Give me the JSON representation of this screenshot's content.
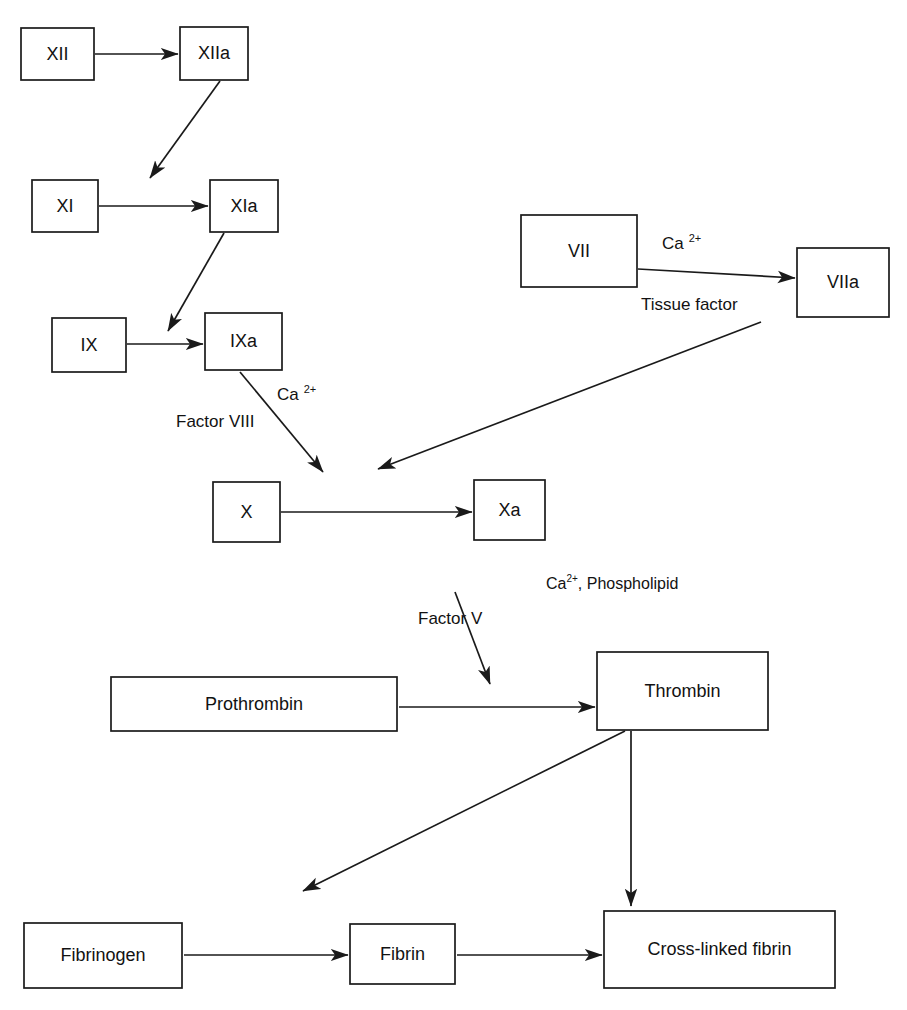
{
  "diagram": {
    "background_color": "#ffffff",
    "stroke_color": "#1a1a1a",
    "text_color": "#121212"
  },
  "nodes": {
    "xii": {
      "label": "XII",
      "x": 21,
      "y": 28,
      "w": 73,
      "h": 52,
      "font_size": 18
    },
    "xiia": {
      "label": "XIIa",
      "x": 180,
      "y": 27,
      "w": 68,
      "h": 53,
      "font_size": 18
    },
    "xi": {
      "label": "XI",
      "x": 32,
      "y": 180,
      "w": 66,
      "h": 52,
      "font_size": 18
    },
    "xia": {
      "label": "XIa",
      "x": 210,
      "y": 180,
      "w": 68,
      "h": 52,
      "font_size": 18
    },
    "ix": {
      "label": "IX",
      "x": 52,
      "y": 318,
      "w": 74,
      "h": 54,
      "font_size": 18
    },
    "ixa": {
      "label": "IXa",
      "x": 205,
      "y": 313,
      "w": 77,
      "h": 57,
      "font_size": 18
    },
    "vii": {
      "label": "VII",
      "x": 521,
      "y": 215,
      "w": 116,
      "h": 72,
      "font_size": 18
    },
    "viia": {
      "label": "VIIa",
      "x": 797,
      "y": 248,
      "w": 92,
      "h": 69,
      "font_size": 18
    },
    "x": {
      "label": "X",
      "x": 213,
      "y": 482,
      "w": 67,
      "h": 60,
      "font_size": 18
    },
    "xa": {
      "label": "Xa",
      "x": 474,
      "y": 480,
      "w": 71,
      "h": 60,
      "font_size": 18
    },
    "prothrombin": {
      "label": "Prothrombin",
      "x": 111,
      "y": 677,
      "w": 286,
      "h": 54,
      "font_size": 18
    },
    "thrombin": {
      "label": "Thrombin",
      "x": 597,
      "y": 652,
      "w": 171,
      "h": 78,
      "font_size": 18
    },
    "fibrinogen": {
      "label": "Fibrinogen",
      "x": 24,
      "y": 923,
      "w": 158,
      "h": 65,
      "font_size": 18
    },
    "fibrin": {
      "label": "Fibrin",
      "x": 350,
      "y": 924,
      "w": 105,
      "h": 60,
      "font_size": 18
    },
    "crosslinked": {
      "label": "Cross-linked fibrin",
      "x": 604,
      "y": 911,
      "w": 231,
      "h": 77,
      "font_size": 18
    }
  },
  "edges": [
    {
      "name": "xii-to-xiia",
      "x1": 95,
      "y1": 54,
      "x2": 178,
      "y2": 54
    },
    {
      "name": "xiia-to-xi-xia",
      "x1": 220,
      "y1": 81,
      "x2": 150,
      "y2": 178
    },
    {
      "name": "xi-to-xia",
      "x1": 99,
      "y1": 206,
      "x2": 208,
      "y2": 206
    },
    {
      "name": "xia-to-ix-ixa",
      "x1": 224,
      "y1": 233,
      "x2": 168,
      "y2": 331
    },
    {
      "name": "ix-to-ixa",
      "x1": 127,
      "y1": 344,
      "x2": 203,
      "y2": 344
    },
    {
      "name": "ixa-to-x",
      "x1": 240,
      "y1": 372,
      "x2": 323,
      "y2": 472
    },
    {
      "name": "vii-to-viia",
      "x1": 638,
      "y1": 269,
      "x2": 795,
      "y2": 278
    },
    {
      "name": "viia-to-x",
      "x1": 761,
      "y1": 322,
      "x2": 378,
      "y2": 469
    },
    {
      "name": "x-to-xa",
      "x1": 281,
      "y1": 512,
      "x2": 472,
      "y2": 512
    },
    {
      "name": "factorv-to-prothrombin",
      "x1": 455,
      "y1": 592,
      "x2": 490,
      "y2": 684
    },
    {
      "name": "prothrombin-to-thrombin",
      "x1": 399,
      "y1": 707,
      "x2": 595,
      "y2": 707
    },
    {
      "name": "thrombin-to-fibrinogen",
      "x1": 625,
      "y1": 731,
      "x2": 303,
      "y2": 891
    },
    {
      "name": "thrombin-to-crosslinked",
      "x1": 631,
      "y1": 731,
      "x2": 631,
      "y2": 906
    },
    {
      "name": "fibrinogen-to-fibrin",
      "x1": 184,
      "y1": 955,
      "x2": 348,
      "y2": 955
    },
    {
      "name": "fibrin-to-crosslinked",
      "x1": 457,
      "y1": 955,
      "x2": 602,
      "y2": 955
    }
  ],
  "edge_labels": [
    {
      "name": "ca-ion-vii",
      "base": "Ca",
      "sup": "2+",
      "tail": "",
      "x": 662,
      "y": 245,
      "font_size": 17,
      "gap": true
    },
    {
      "name": "tissue-factor",
      "base": "Tissue factor",
      "sup": "",
      "tail": "",
      "x": 641,
      "y": 306,
      "font_size": 17,
      "gap": false
    },
    {
      "name": "ca-ion-ixa",
      "base": "Ca",
      "sup": "2+",
      "tail": "",
      "x": 277,
      "y": 396,
      "font_size": 17,
      "gap": true
    },
    {
      "name": "factor-viii",
      "base": "Factor VIII",
      "sup": "",
      "tail": "",
      "x": 176,
      "y": 423,
      "font_size": 17,
      "gap": false
    },
    {
      "name": "ca-phospholipid",
      "base": "Ca",
      "sup": "2+",
      "tail": ", Phospholipid",
      "x": 546,
      "y": 585,
      "font_size": 16,
      "gap": false
    },
    {
      "name": "factor-v",
      "base": "Factor V",
      "sup": "",
      "tail": "",
      "x": 418,
      "y": 620,
      "font_size": 17,
      "gap": false
    }
  ]
}
